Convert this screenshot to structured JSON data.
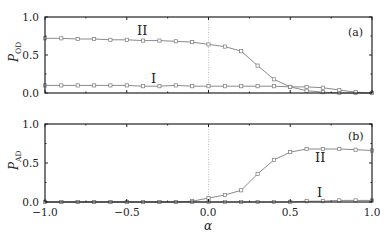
{
  "chart_data": [
    {
      "type": "line",
      "panel_label": "(a)",
      "ylabel": "P",
      "ylabel_sub": "OD",
      "xlabel": "",
      "xlim": [
        -1.0,
        1.0
      ],
      "ylim": [
        0.0,
        1.0
      ],
      "yticks": [
        "0.0",
        "0.5",
        "1.0"
      ],
      "x": [
        -1.0,
        -0.9,
        -0.8,
        -0.7,
        -0.6,
        -0.5,
        -0.4,
        -0.3,
        -0.2,
        -0.1,
        0.0,
        0.1,
        0.2,
        0.3,
        0.4,
        0.5,
        0.6,
        0.7,
        0.8,
        0.9,
        1.0
      ],
      "series": [
        {
          "name": "II",
          "values": [
            0.72,
            0.72,
            0.71,
            0.71,
            0.7,
            0.7,
            0.69,
            0.69,
            0.68,
            0.67,
            0.64,
            0.61,
            0.55,
            0.36,
            0.18,
            0.08,
            0.03,
            0.01,
            0.0,
            0.0,
            0.0
          ]
        },
        {
          "name": "I",
          "values": [
            0.1,
            0.1,
            0.1,
            0.1,
            0.1,
            0.1,
            0.09,
            0.09,
            0.1,
            0.09,
            0.09,
            0.09,
            0.09,
            0.09,
            0.09,
            0.08,
            0.08,
            0.07,
            0.04,
            0.01,
            0.0
          ]
        }
      ],
      "zero_line_x": 0.0,
      "grid": false
    },
    {
      "type": "line",
      "panel_label": "(b)",
      "ylabel": "P",
      "ylabel_sub": "AD",
      "xlabel": "α",
      "xlim": [
        -1.0,
        1.0
      ],
      "ylim": [
        0.0,
        1.0
      ],
      "yticks": [
        "0.0",
        "0.5",
        "1.0"
      ],
      "xticks": [
        "−1.0",
        "−0.5",
        "0.0",
        "0.5",
        "1.0"
      ],
      "x": [
        -1.0,
        -0.9,
        -0.8,
        -0.7,
        -0.6,
        -0.5,
        -0.4,
        -0.3,
        -0.2,
        -0.1,
        0.0,
        0.1,
        0.2,
        0.3,
        0.4,
        0.5,
        0.6,
        0.7,
        0.8,
        0.9,
        1.0
      ],
      "series": [
        {
          "name": "II",
          "values": [
            0.0,
            0.0,
            0.0,
            0.0,
            0.0,
            0.0,
            0.0,
            0.0,
            0.0,
            0.01,
            0.05,
            0.09,
            0.15,
            0.36,
            0.54,
            0.64,
            0.68,
            0.68,
            0.68,
            0.67,
            0.66
          ]
        },
        {
          "name": "I",
          "values": [
            0.0,
            0.0,
            0.0,
            0.0,
            0.0,
            0.0,
            0.0,
            0.0,
            0.0,
            0.0,
            0.0,
            0.0,
            0.0,
            0.0,
            0.0,
            0.0,
            0.01,
            0.01,
            0.02,
            0.02,
            0.02
          ]
        }
      ],
      "zero_line_x": 0.0,
      "grid": false
    }
  ],
  "labels": {
    "panel_a": "(a)",
    "panel_b": "(b)",
    "curve_II": "II",
    "curve_I": "I",
    "ylabel_P": "P",
    "ylabel_a_sub": "OD",
    "ylabel_b_sub": "AD",
    "xlabel": "α",
    "yticks": [
      "0.0",
      "0.5",
      "1.0"
    ],
    "xticks": [
      "−1.0",
      "−0.5",
      "0.0",
      "0.5",
      "1.0"
    ]
  },
  "colors": {
    "axis": "#222222",
    "curve": "#8a8a8a",
    "marker": "#7a7a7a",
    "zero_line": "#9a9a9a"
  }
}
